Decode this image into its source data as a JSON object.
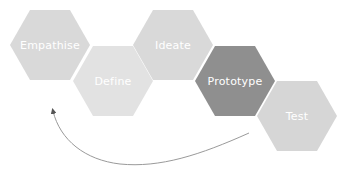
{
  "diagram": {
    "type": "design-thinking-process",
    "stages": [
      {
        "label": "Empathise",
        "color": "#d9d9d9",
        "x": 10,
        "y": 10
      },
      {
        "label": "Define",
        "color": "#e2e2e2",
        "x": 73,
        "y": 46
      },
      {
        "label": "Ideate",
        "color": "#d9d9d9",
        "x": 133,
        "y": 10
      },
      {
        "label": "Prototype",
        "color": "#8f8f8f",
        "x": 195,
        "y": 46
      },
      {
        "label": "Test",
        "color": "#d6d6d6",
        "x": 257,
        "y": 81
      }
    ],
    "arrow": {
      "description": "Curved feedback arrow from Test back to Empathise",
      "color": "#9a9a9a"
    }
  }
}
